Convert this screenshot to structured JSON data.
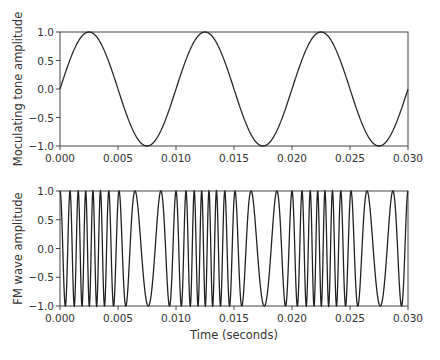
{
  "chart_data": [
    {
      "type": "line",
      "title": "",
      "xlabel": "",
      "ylabel": "Moculating tone amplitude",
      "xlim": [
        0.0,
        0.03
      ],
      "ylim": [
        -1.0,
        1.0
      ],
      "xticks": [
        "0.000",
        "0.005",
        "0.010",
        "0.015",
        "0.020",
        "0.025",
        "0.030"
      ],
      "yticks": [
        "1.0",
        "0.5",
        "0.0",
        "−0.5",
        "−1.0"
      ],
      "series": [
        {
          "name": "modulating tone",
          "function": "sin(2*pi*100*t)",
          "frequency_hz": 100,
          "amplitude": 1.0
        }
      ],
      "grid": false
    },
    {
      "type": "line",
      "title": "",
      "xlabel": "Time (seconds)",
      "ylabel": "FM wave amplitude",
      "xlim": [
        0.0,
        0.03
      ],
      "ylim": [
        -1.0,
        1.0
      ],
      "xticks": [
        "0.000",
        "0.005",
        "0.010",
        "0.015",
        "0.020",
        "0.025",
        "0.030"
      ],
      "yticks": [
        "1.0",
        "0.5",
        "0.0",
        "−0.5",
        "−1.0"
      ],
      "series": [
        {
          "name": "FM wave",
          "carrier_hz": 1000,
          "deviation_hz": 600,
          "modulating_hz": 100,
          "amplitude": 1.0
        }
      ],
      "grid": false
    }
  ]
}
